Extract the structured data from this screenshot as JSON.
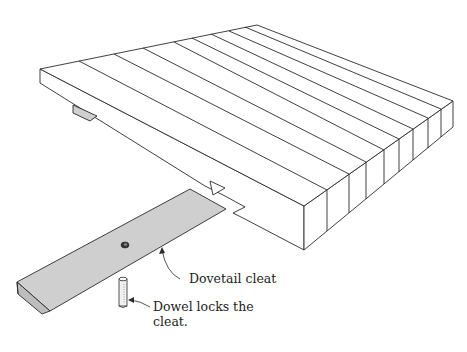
{
  "figure": {
    "parts": [
      {
        "id": "tabletop",
        "description": "Glued-up panel of edge-joined boards with sliding dovetail slot"
      },
      {
        "id": "cleat",
        "description": "Dovetail cleat (shaded) with dowel hole"
      },
      {
        "id": "dowel",
        "description": "Dowel pin"
      }
    ],
    "board_count": 10,
    "colors": {
      "line": "#2a2a2a",
      "shade": "#cfcfcf",
      "background": "#ffffff"
    }
  },
  "callouts": [
    {
      "id": "dovetail-cleat",
      "text": "Dovetail cleat"
    },
    {
      "id": "dowel",
      "line1": "Dowel locks the",
      "line2": "cleat."
    }
  ]
}
